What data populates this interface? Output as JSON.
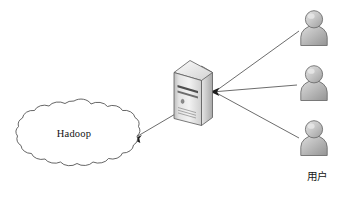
{
  "diagram": {
    "background_color": "#ffffff",
    "nodes": {
      "cloud": {
        "icon": "cloud-icon",
        "label": "Hadoop",
        "shape": "scalloped-cloud",
        "stroke_color": "#4a4a4a",
        "fill_color": "#ffffff",
        "x": 8,
        "y": 100,
        "width": 132,
        "height": 80
      },
      "server": {
        "icon": "server-tower-icon",
        "label": "",
        "shape": "isometric-tower",
        "body_color": "#d8d8d8",
        "side_color": "#9a9a9a",
        "top_color": "#efefef",
        "stroke_color": "#5a5a5a",
        "x": 172,
        "y": 60,
        "width": 42,
        "height": 66
      },
      "users": [
        {
          "icon": "user-icon",
          "label": "",
          "x": 298,
          "y": 10,
          "width": 32,
          "height": 36
        },
        {
          "icon": "user-icon",
          "label": "",
          "x": 298,
          "y": 65,
          "width": 32,
          "height": 36
        },
        {
          "icon": "user-icon",
          "label": "",
          "x": 298,
          "y": 120,
          "width": 32,
          "height": 36
        }
      ],
      "users_group_label": "用户"
    },
    "user_icon_colors": {
      "head_fill": "#c9c9c9",
      "body_fill": "#bdbdbd",
      "stroke": "#6e6e6e",
      "highlight": "#e8e8e8"
    },
    "edges": [
      {
        "name": "user-1-to-server",
        "from": "user-top",
        "to": "server",
        "arrow": "to-server",
        "style": "solid"
      },
      {
        "name": "user-2-to-server",
        "from": "user-middle",
        "to": "server",
        "arrow": "to-server",
        "style": "solid"
      },
      {
        "name": "user-3-to-server",
        "from": "user-bottom",
        "to": "server",
        "arrow": "to-server",
        "style": "solid"
      },
      {
        "name": "server-to-hadoop",
        "from": "server",
        "to": "cloud",
        "arrow": "to-cloud",
        "style": "solid"
      }
    ],
    "edge_color": "#5b5b5b",
    "arrow_color": "#1d1d1d"
  }
}
